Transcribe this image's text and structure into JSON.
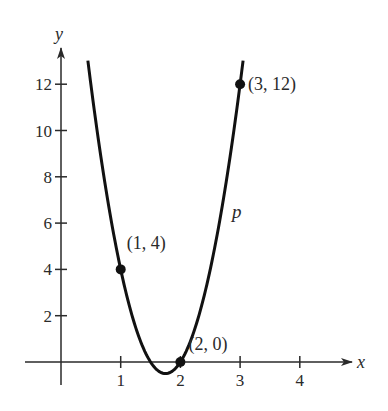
{
  "chart_data": {
    "type": "line",
    "title": "",
    "xlabel": "x",
    "ylabel": "y",
    "xlim": [
      -0.3,
      4.9
    ],
    "ylim": [
      -1,
      13.3
    ],
    "grid": false,
    "legend": null,
    "x_ticks": [
      1,
      2,
      3,
      4
    ],
    "x_tick_labels": [
      "1",
      "2",
      "3",
      "4"
    ],
    "y_ticks": [
      2,
      4,
      6,
      8,
      10,
      12
    ],
    "y_tick_labels": [
      "2",
      "4",
      "6",
      "8",
      "10",
      "12"
    ],
    "series": [
      {
        "name": "p",
        "equation": "p(x) = 8x^2 - 28x + 24",
        "x": [
          0.45,
          1,
          1.5,
          1.75,
          2,
          2.5,
          3,
          3.05
        ],
        "values": [
          12.98,
          4,
          0,
          -0.5,
          0,
          4,
          12,
          12.82
        ]
      }
    ],
    "points": [
      {
        "x": 1,
        "y": 4,
        "label": "(1, 4)"
      },
      {
        "x": 2,
        "y": 0,
        "label": "(2, 0)"
      },
      {
        "x": 3,
        "y": 12,
        "label": "(3, 12)"
      }
    ],
    "annotations": [
      {
        "text": "p",
        "x": 3.0,
        "y": 6.4
      }
    ],
    "colors": {
      "curve": "#111111",
      "axes": "#2a2a2a"
    }
  }
}
